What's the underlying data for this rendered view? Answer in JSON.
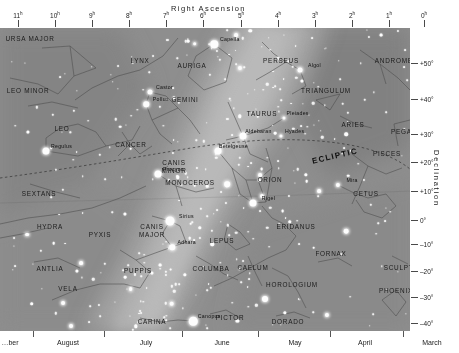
{
  "axes": {
    "ra_title": "Right Ascension",
    "dec_title": "Declination",
    "ra_ticks": [
      {
        "label": "11",
        "unit": "h",
        "x": 18
      },
      {
        "label": "10",
        "unit": "h",
        "x": 55
      },
      {
        "label": "9",
        "unit": "h",
        "x": 92
      },
      {
        "label": "8",
        "unit": "h",
        "x": 129
      },
      {
        "label": "7",
        "unit": "h",
        "x": 166
      },
      {
        "label": "6",
        "unit": "h",
        "x": 203
      },
      {
        "label": "5",
        "unit": "h",
        "x": 241
      },
      {
        "label": "4",
        "unit": "h",
        "x": 278
      },
      {
        "label": "3",
        "unit": "h",
        "x": 315
      },
      {
        "label": "2",
        "unit": "h",
        "x": 352
      },
      {
        "label": "1",
        "unit": "h",
        "x": 389
      },
      {
        "label": "0",
        "unit": "h",
        "x": 424
      }
    ],
    "dec_ticks": [
      {
        "label": "+50°",
        "y": 35
      },
      {
        "label": "+40°",
        "y": 71
      },
      {
        "label": "+30°",
        "y": 106
      },
      {
        "label": "+20°",
        "y": 134
      },
      {
        "label": "+10°",
        "y": 163
      },
      {
        "label": "0°",
        "y": 192
      },
      {
        "label": "–10°",
        "y": 216
      },
      {
        "label": "–20°",
        "y": 243
      },
      {
        "label": "–30°",
        "y": 269
      },
      {
        "label": "–40°",
        "y": 295
      },
      {
        "label": "–50°",
        "y": 320
      }
    ],
    "months": [
      {
        "label": "…ber",
        "x": 10,
        "sep": null
      },
      {
        "label": "August",
        "x": 68,
        "sep": 33
      },
      {
        "label": "July",
        "x": 146,
        "sep": 104
      },
      {
        "label": "June",
        "x": 222,
        "sep": 182
      },
      {
        "label": "May",
        "x": 295,
        "sep": 258
      },
      {
        "label": "April",
        "x": 365,
        "sep": 330
      },
      {
        "label": "March",
        "x": 432,
        "sep": 403
      }
    ]
  },
  "chart_data": {
    "type": "scatter",
    "xlabel": "Right Ascension",
    "ylabel": "Declination",
    "xlim": [
      "11h",
      "0h"
    ],
    "ylim": [
      "+50°",
      "–50°"
    ],
    "grid": false,
    "legend": "none",
    "annotations": [
      "ECLIPTIC"
    ],
    "colors": {
      "sky_background": "#8e8e8e",
      "milky_way_mid": "#9e9e9e",
      "milky_way_bright": "#b4b4b4",
      "dark_region": "#7d7d7d",
      "star": "#fdfdfd",
      "constellation_line": "#5a5a5a",
      "label_text": "#1b1b1b",
      "axis_text": "#222222",
      "page_background": "#ffffff"
    },
    "constellations": [
      {
        "name": "URSA MAJOR",
        "x": 30,
        "y": 11
      },
      {
        "name": "LYNX",
        "x": 140,
        "y": 33
      },
      {
        "name": "AURIGA",
        "x": 192,
        "y": 38
      },
      {
        "name": "PERSEUS",
        "x": 281,
        "y": 33
      },
      {
        "name": "ANDROMEDA",
        "x": 399,
        "y": 33
      },
      {
        "name": "LEO MINOR",
        "x": 28,
        "y": 63
      },
      {
        "name": "GEMINI",
        "x": 185,
        "y": 72
      },
      {
        "name": "TAURUS",
        "x": 262,
        "y": 86
      },
      {
        "name": "TRIANGULUM",
        "x": 326,
        "y": 63
      },
      {
        "name": "ARIES",
        "x": 353,
        "y": 97
      },
      {
        "name": "PEGASUS",
        "x": 409,
        "y": 104
      },
      {
        "name": "LEO",
        "x": 62,
        "y": 101
      },
      {
        "name": "CANCER",
        "x": 131,
        "y": 117
      },
      {
        "name": "PISCES",
        "x": 387,
        "y": 126
      },
      {
        "name": "CANIS\nMINOR",
        "x": 174,
        "y": 138
      },
      {
        "name": "MONOCEROS",
        "x": 190,
        "y": 155
      },
      {
        "name": "ORION",
        "x": 270,
        "y": 152
      },
      {
        "name": "SEXTANS",
        "x": 39,
        "y": 166
      },
      {
        "name": "HYDRA",
        "x": 50,
        "y": 199
      },
      {
        "name": "CETUS",
        "x": 366,
        "y": 166
      },
      {
        "name": "CANIS\nMAJOR",
        "x": 152,
        "y": 202
      },
      {
        "name": "LEPUS",
        "x": 222,
        "y": 213
      },
      {
        "name": "ERIDANUS",
        "x": 296,
        "y": 199
      },
      {
        "name": "PYXIS",
        "x": 100,
        "y": 207
      },
      {
        "name": "FORNAX",
        "x": 331,
        "y": 226
      },
      {
        "name": "SCULPTOR",
        "x": 404,
        "y": 240
      },
      {
        "name": "ANTLIA",
        "x": 50,
        "y": 241
      },
      {
        "name": "PUPPIS",
        "x": 138,
        "y": 243
      },
      {
        "name": "COLUMBA",
        "x": 211,
        "y": 241
      },
      {
        "name": "CAELUM",
        "x": 253,
        "y": 240
      },
      {
        "name": "VELA",
        "x": 68,
        "y": 261
      },
      {
        "name": "HOROLOGIUM",
        "x": 292,
        "y": 257
      },
      {
        "name": "PHOENIX",
        "x": 396,
        "y": 263
      },
      {
        "name": "CARINA",
        "x": 152,
        "y": 294
      },
      {
        "name": "PICTOR",
        "x": 230,
        "y": 290
      },
      {
        "name": "DORADO",
        "x": 288,
        "y": 294
      }
    ],
    "named_stars": [
      {
        "name": "Capella",
        "x": 214,
        "y": 16,
        "mag": 0.1,
        "size": 7.5
      },
      {
        "name": "Algol",
        "x": 300,
        "y": 42,
        "mag": 2.1,
        "size": 5.0
      },
      {
        "name": "Castor",
        "x": 150,
        "y": 64,
        "mag": 1.6,
        "size": 5.0
      },
      {
        "name": "Pollux",
        "x": 146,
        "y": 76,
        "mag": 1.1,
        "size": 5.5
      },
      {
        "name": "Pleiades",
        "x": 284,
        "y": 90,
        "mag": 1.6,
        "size": 3.2
      },
      {
        "name": "Hyades",
        "x": 281,
        "y": 108,
        "mag": 0.9,
        "size": 3.2
      },
      {
        "name": "Aldebaran",
        "x": 243,
        "y": 108,
        "mag": 0.9,
        "size": 7.0
      },
      {
        "name": "Betelgeuse",
        "x": 218,
        "y": 123,
        "mag": 0.5,
        "size": 7.0
      },
      {
        "name": "Regulus",
        "x": 46,
        "y": 123,
        "mag": 1.4,
        "size": 7.0
      },
      {
        "name": "Procyon",
        "x": 158,
        "y": 146,
        "mag": 0.4,
        "size": 7.0
      },
      {
        "name": "Rigel",
        "x": 253,
        "y": 175,
        "mag": 0.1,
        "size": 7.0
      },
      {
        "name": "Mira",
        "x": 338,
        "y": 157,
        "mag": 3.0,
        "size": 4.2
      },
      {
        "name": "Sirius",
        "x": 170,
        "y": 193,
        "mag": -1.5,
        "size": 9.0
      },
      {
        "name": "Adhara",
        "x": 172,
        "y": 219,
        "mag": 1.5,
        "size": 5.5
      },
      {
        "name": "Canopus",
        "x": 193,
        "y": 293,
        "mag": -0.7,
        "size": 8.5
      }
    ]
  }
}
